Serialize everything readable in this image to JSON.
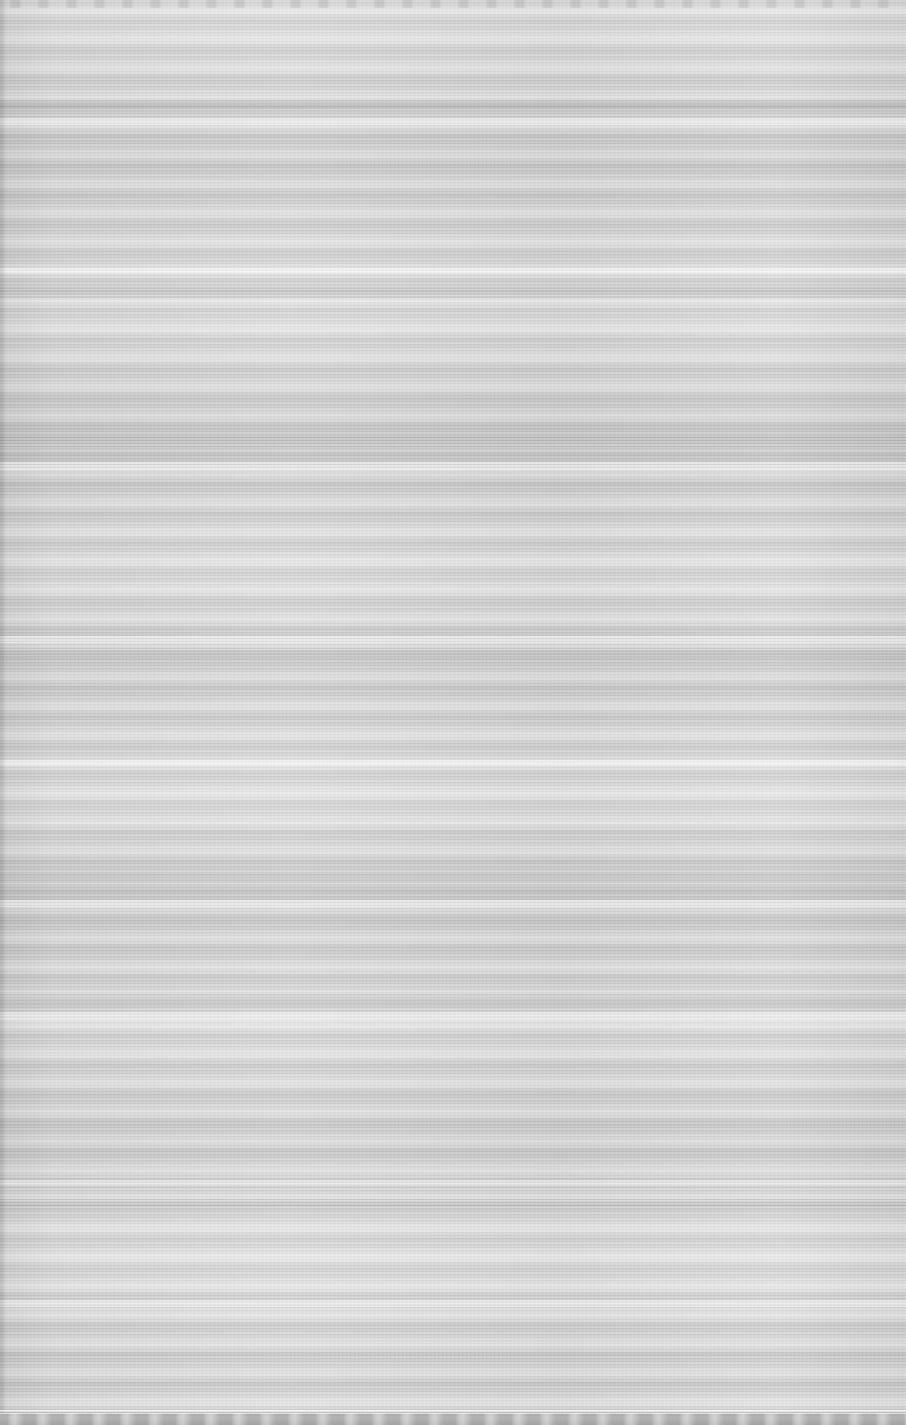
{
  "capture": {
    "width": 906,
    "height": 1425,
    "state": "corrupted",
    "corruption_type": "horizontal-scanline-smear",
    "legible_text": "none",
    "note": "Screenshot content is destroyed by horizontal smear; no text, icons or widgets are readable."
  },
  "palette": {
    "field_base": "#cccccc",
    "field_light": "#dcdcdc",
    "field_dark": "#b6b6b6",
    "separator": "#b0b0b0",
    "gutter": "#bdbdbd",
    "taskbar": "#a8a8a8",
    "taskbar_highlight": "#d2d2d2",
    "top_chrome": "#c2c2c2"
  },
  "structure": {
    "left_gutter": {
      "x": 0,
      "width": 6,
      "label": "left-gutter"
    },
    "top_chrome": {
      "y": 0,
      "height": 8,
      "item_pitch": 28,
      "label": "top-chrome-strip"
    },
    "taskbar": {
      "y": 1413,
      "height": 12,
      "item_pitch": 28,
      "item_count": 32,
      "label": "bottom-taskbar"
    },
    "scanlines": {
      "pitch": 6,
      "row_rhythm_pitch": 29,
      "char_ghost_pitch": 4
    },
    "separator_bands": [
      {
        "y": 100,
        "height": 9,
        "name": "separator-band-1"
      },
      {
        "y": 288,
        "height": 10,
        "name": "separator-band-2"
      },
      {
        "y": 437,
        "height": 12,
        "name": "separator-band-3"
      },
      {
        "y": 648,
        "height": 8,
        "name": "separator-band-4"
      },
      {
        "y": 874,
        "height": 9,
        "name": "separator-band-5"
      },
      {
        "y": 994,
        "height": 10,
        "name": "separator-band-6"
      },
      {
        "y": 1199,
        "height": 8,
        "name": "separator-band-7"
      }
    ],
    "bright_bands": [
      {
        "y": 118,
        "height": 7,
        "name": "bright-band-1"
      },
      {
        "y": 268,
        "height": 6,
        "name": "bright-band-2"
      },
      {
        "y": 462,
        "height": 9,
        "name": "bright-band-3"
      },
      {
        "y": 636,
        "height": 7,
        "name": "bright-band-4"
      },
      {
        "y": 760,
        "height": 6,
        "name": "bright-band-5"
      },
      {
        "y": 900,
        "height": 7,
        "name": "bright-band-6"
      },
      {
        "y": 1012,
        "height": 8,
        "name": "bright-band-7"
      },
      {
        "y": 1180,
        "height": 6,
        "name": "bright-band-8"
      },
      {
        "y": 1300,
        "height": 7,
        "name": "bright-band-9"
      }
    ]
  }
}
